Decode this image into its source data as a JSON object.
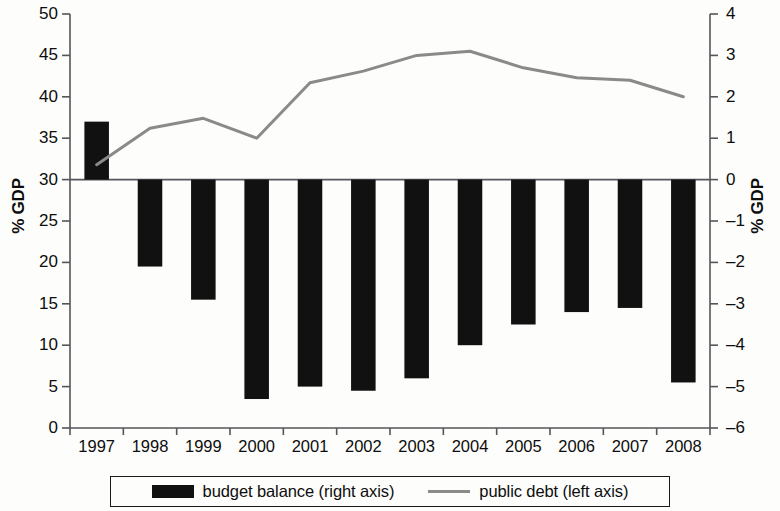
{
  "chart_data": {
    "type": "bar",
    "title": "",
    "subtitle": "",
    "xlabel": "",
    "ylabel": "% GDP",
    "ylabel_right": "% GDP",
    "categories": [
      "1997",
      "1998",
      "1999",
      "2000",
      "2001",
      "2002",
      "2003",
      "2004",
      "2005",
      "2006",
      "2007",
      "2008"
    ],
    "ylim": [
      0,
      50
    ],
    "ylim_right": [
      -6,
      4
    ],
    "yticks": [
      0,
      5,
      10,
      15,
      20,
      25,
      30,
      35,
      40,
      45,
      50
    ],
    "yticks_right": [
      -6,
      -5,
      -4,
      -3,
      -2,
      -1,
      0,
      1,
      2,
      3,
      4
    ],
    "ytick_labels": [
      "0",
      "5",
      "10",
      "15",
      "20",
      "25",
      "30",
      "35",
      "40",
      "45",
      "50"
    ],
    "ytick_labels_right": [
      "–6",
      "–5",
      "–4",
      "–3",
      "–2",
      "–1",
      "0",
      "1",
      "2",
      "3",
      "4"
    ],
    "grid": false,
    "legend_position": "bottom",
    "series": [
      {
        "name": "budget balance (right axis)",
        "type": "bar",
        "axis": "right",
        "color": "#111111",
        "values": [
          1.4,
          -2.1,
          -2.9,
          -5.3,
          -5.0,
          -5.1,
          -4.8,
          -4.0,
          -3.5,
          -3.2,
          -3.1,
          -4.9
        ]
      },
      {
        "name": "public debt (left axis)",
        "type": "line",
        "axis": "left",
        "color": "#8a8a8a",
        "values": [
          31.8,
          36.2,
          37.4,
          35.0,
          41.7,
          43.1,
          45.0,
          45.5,
          43.5,
          42.3,
          42.0,
          40.0
        ]
      }
    ]
  },
  "legend": {
    "entries": [
      {
        "label": "budget balance (right axis)",
        "marker": "bar-swatch",
        "color": "#111111"
      },
      {
        "label": "public debt (left axis)",
        "marker": "line-swatch",
        "color": "#8a8a8a"
      }
    ]
  },
  "axes": {
    "left_title": "% GDP",
    "right_title": "% GDP"
  }
}
